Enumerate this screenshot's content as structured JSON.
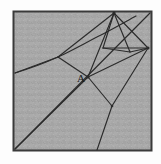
{
  "figure": {
    "kind": "geometric-line-diagram",
    "caption": "",
    "background_color": "#a8a8a8",
    "paper_color": "#fdfdfd",
    "border_color": "#3a3a3a",
    "line_color": "#2b2b2b",
    "frame": {
      "x": 13,
      "y": 11,
      "width": 139,
      "height": 140
    },
    "labels": [
      {
        "name": "point-a",
        "text": "A",
        "x": 77,
        "y": 82
      }
    ],
    "vertices": [
      {
        "name": "apex-top",
        "x": 114,
        "y": 13
      },
      {
        "name": "node-right",
        "x": 148,
        "y": 48
      },
      {
        "name": "node-a",
        "x": 88,
        "y": 77
      },
      {
        "name": "node-left",
        "x": 58,
        "y": 57
      },
      {
        "name": "node-lower",
        "x": 112,
        "y": 106
      },
      {
        "name": "quad-left",
        "x": 103,
        "y": 48
      },
      {
        "name": "quad-right",
        "x": 130,
        "y": 52
      },
      {
        "name": "corner-bottom-left",
        "x": 14,
        "y": 150
      },
      {
        "name": "corner-top-right",
        "x": 151,
        "y": 12
      }
    ],
    "segments": [
      {
        "name": "seg-apex-to-right",
        "x1": 114,
        "y1": 13,
        "x2": 148,
        "y2": 48
      },
      {
        "name": "seg-apex-to-quadleft",
        "x1": 114,
        "y1": 13,
        "x2": 103,
        "y2": 48
      },
      {
        "name": "seg-apex-to-quadright",
        "x1": 114,
        "y1": 13,
        "x2": 130,
        "y2": 52
      },
      {
        "name": "seg-apex-to-nodea",
        "x1": 114,
        "y1": 13,
        "x2": 88,
        "y2": 77
      },
      {
        "name": "seg-apex-to-nodeleft",
        "x1": 114,
        "y1": 13,
        "x2": 58,
        "y2": 57
      },
      {
        "name": "seg-quad-base",
        "x1": 103,
        "y1": 48,
        "x2": 130,
        "y2": 52
      },
      {
        "name": "seg-quadleft-to-right",
        "x1": 103,
        "y1": 48,
        "x2": 148,
        "y2": 48
      },
      {
        "name": "seg-quadright-to-right",
        "x1": 130,
        "y1": 52,
        "x2": 148,
        "y2": 48
      },
      {
        "name": "seg-right-to-nodea",
        "x1": 148,
        "y1": 48,
        "x2": 88,
        "y2": 77
      },
      {
        "name": "seg-right-to-lower",
        "x1": 148,
        "y1": 48,
        "x2": 112,
        "y2": 106
      },
      {
        "name": "seg-nodea-to-nodeleft",
        "x1": 88,
        "y1": 77,
        "x2": 58,
        "y2": 57
      },
      {
        "name": "seg-nodea-to-lower",
        "x1": 88,
        "y1": 77,
        "x2": 112,
        "y2": 106
      },
      {
        "name": "seg-nodea-to-edge-left",
        "x1": 88,
        "y1": 77,
        "x2": 14,
        "y2": 150
      },
      {
        "name": "seg-lower-to-bottom",
        "x1": 112,
        "y1": 106,
        "x2": 97,
        "y2": 151
      },
      {
        "name": "seg-apex-to-topright-corner",
        "x1": 114,
        "y1": 13,
        "x2": 151,
        "y2": 12
      },
      {
        "name": "seg-right-to-upper-edge",
        "x1": 148,
        "y1": 48,
        "x2": 151,
        "y2": 12
      },
      {
        "name": "seg-right-to-bottom-edge",
        "x1": 148,
        "y1": 48,
        "x2": 151,
        "y2": 151
      },
      {
        "name": "seg-nodeleft-to-left-edge",
        "x1": 58,
        "y1": 57,
        "x2": 14,
        "y2": 73
      },
      {
        "name": "seg-diagonal-corner",
        "x1": 14,
        "y1": 150,
        "x2": 151,
        "y2": 12
      }
    ],
    "curves": [
      {
        "name": "arc-left-upper",
        "path": "M 14,73 C 30,68 46,62 58,57 C 72,50 86,42 100,35 C 112,29 124,22 135,16"
      }
    ]
  }
}
